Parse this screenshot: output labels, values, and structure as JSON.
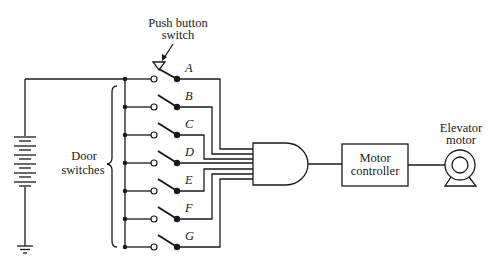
{
  "diagram": {
    "type": "circuit-schematic",
    "labels": {
      "push_button": [
        "Push button",
        "switch"
      ],
      "door_switches": [
        "Door",
        "switches"
      ],
      "motor_controller": [
        "Motor",
        "controller"
      ],
      "elevator_motor": [
        "Elevator",
        "motor"
      ]
    },
    "switches": [
      {
        "id": "A",
        "kind": "push-button"
      },
      {
        "id": "B",
        "kind": "door"
      },
      {
        "id": "C",
        "kind": "door"
      },
      {
        "id": "D",
        "kind": "door"
      },
      {
        "id": "E",
        "kind": "door"
      },
      {
        "id": "F",
        "kind": "door"
      },
      {
        "id": "G",
        "kind": "door"
      }
    ],
    "components": [
      "battery",
      "ground",
      "and-gate",
      "motor-controller",
      "elevator-motor"
    ],
    "colors": {
      "ink": "#1a1a1a",
      "background": "#ffffff"
    }
  }
}
